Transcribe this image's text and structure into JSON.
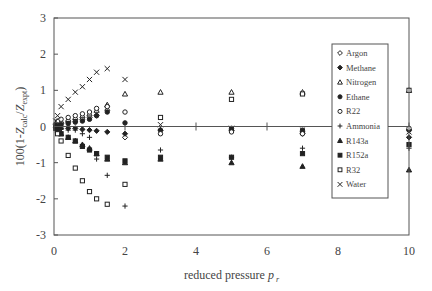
{
  "chart_data": {
    "type": "scatter",
    "title": "",
    "xlabel": "reduced pressure p_r",
    "xlabel_main": "reduced pressure ",
    "xlabel_var": "p",
    "xlabel_sub": "r",
    "ylabel": "100(1-Z_calc/Z_expt)",
    "ylabel_parts": {
      "prefix": "100(1-",
      "z1": "Z",
      "sub1": "calc",
      "slash": "/",
      "z2": "Z",
      "sub2": "expt",
      "suffix": ")"
    },
    "xlim": [
      0,
      10
    ],
    "ylim": [
      -3,
      3
    ],
    "xticks": [
      0,
      2,
      4,
      6,
      8,
      10
    ],
    "yticks": [
      -3,
      -2,
      -1,
      0,
      1,
      2,
      3
    ],
    "grid": false,
    "zero_line": true,
    "legend_position": "upper right (inside)",
    "series": [
      {
        "name": "Argon",
        "marker": "open-diamond",
        "x": [
          0.05,
          0.1,
          0.2,
          0.4,
          0.6,
          0.8,
          1.0,
          1.2,
          1.5,
          2.0,
          3.0,
          5.0,
          7.0,
          10.0
        ],
        "y": [
          0.05,
          0.05,
          0.08,
          0.12,
          0.15,
          0.2,
          0.25,
          0.3,
          0.45,
          -0.3,
          -0.1,
          -0.1,
          -0.2,
          -0.1
        ]
      },
      {
        "name": "Methane",
        "marker": "filled-diamond",
        "x": [
          0.05,
          0.1,
          0.2,
          0.4,
          0.6,
          0.8,
          1.0,
          1.2,
          1.5,
          2.0,
          3.0,
          5.0,
          7.0,
          10.0
        ],
        "y": [
          -0.02,
          -0.03,
          -0.05,
          -0.05,
          -0.05,
          -0.08,
          -0.1,
          -0.12,
          -0.15,
          -0.2,
          -0.1,
          -0.1,
          -0.15,
          -0.3
        ]
      },
      {
        "name": "Nitrogen",
        "marker": "open-triangle",
        "x": [
          0.1,
          0.2,
          0.4,
          0.6,
          0.8,
          1.0,
          1.2,
          1.5,
          2.0,
          3.0,
          5.0,
          7.0,
          10.0
        ],
        "y": [
          0.1,
          0.15,
          0.2,
          0.25,
          0.3,
          0.35,
          0.45,
          0.6,
          0.9,
          0.95,
          0.95,
          0.95,
          1.0
        ]
      },
      {
        "name": "Ethane",
        "marker": "filled-circle",
        "x": [
          0.05,
          0.1,
          0.2,
          0.4,
          0.6,
          0.8,
          1.0,
          1.2,
          1.5,
          2.0,
          3.0,
          5.0,
          7.0,
          10.0
        ],
        "y": [
          0.02,
          0.03,
          0.05,
          0.08,
          0.12,
          0.15,
          0.2,
          0.3,
          0.4,
          0.1,
          -0.1,
          -0.05,
          -0.1,
          -0.1
        ]
      },
      {
        "name": "R22",
        "marker": "open-circle",
        "x": [
          0.1,
          0.2,
          0.4,
          0.6,
          0.8,
          1.0,
          1.2,
          1.5,
          2.0,
          3.0,
          5.0,
          7.0,
          10.0
        ],
        "y": [
          0.15,
          0.2,
          0.25,
          0.3,
          0.35,
          0.4,
          0.5,
          0.55,
          0.4,
          -0.2,
          -0.15,
          -0.2,
          -0.05
        ]
      },
      {
        "name": "Ammonia",
        "marker": "plus",
        "x": [
          0.05,
          0.1,
          0.2,
          0.4,
          0.6,
          0.8,
          1.0,
          1.2,
          1.5,
          2.0,
          3.0,
          5.0,
          7.0,
          10.0
        ],
        "y": [
          -0.05,
          -0.05,
          -0.08,
          -0.1,
          -0.1,
          -0.2,
          -0.3,
          -0.9,
          -1.35,
          -2.2,
          -0.65,
          -0.85,
          -0.6,
          -0.6
        ]
      },
      {
        "name": "R143a",
        "marker": "filled-triangle",
        "x": [
          0.1,
          0.2,
          0.4,
          0.6,
          0.8,
          1.0,
          1.2,
          1.5,
          2.0,
          3.0,
          5.0,
          7.0,
          10.0
        ],
        "y": [
          -0.1,
          -0.2,
          -0.3,
          -0.4,
          -0.5,
          -0.6,
          -0.75,
          -0.9,
          -1.0,
          -0.9,
          -1.0,
          -1.1,
          -1.2
        ]
      },
      {
        "name": "R152a",
        "marker": "filled-square",
        "x": [
          0.05,
          0.1,
          0.2,
          0.4,
          0.6,
          0.8,
          1.0,
          1.2,
          1.5,
          2.0,
          3.0,
          5.0,
          7.0,
          10.0
        ],
        "y": [
          -0.05,
          -0.1,
          -0.2,
          -0.3,
          -0.4,
          -0.55,
          -0.65,
          -0.75,
          -0.85,
          -0.95,
          -0.85,
          -0.85,
          -0.75,
          -0.5
        ]
      },
      {
        "name": "R32",
        "marker": "open-square",
        "x": [
          0.1,
          0.2,
          0.4,
          0.6,
          0.8,
          1.0,
          1.2,
          1.5,
          2.0,
          3.0,
          5.0,
          7.0,
          10.0
        ],
        "y": [
          -0.2,
          -0.4,
          -0.8,
          -1.15,
          -1.5,
          -1.8,
          -2.0,
          -2.15,
          -1.6,
          0.25,
          0.75,
          0.9,
          1.0
        ]
      },
      {
        "name": "Water",
        "marker": "x",
        "x": [
          0.05,
          0.1,
          0.2,
          0.4,
          0.6,
          0.8,
          1.0,
          1.2,
          1.5,
          2.0,
          3.0,
          5.0,
          7.0,
          10.0
        ],
        "y": [
          0.15,
          0.3,
          0.55,
          0.75,
          0.95,
          1.1,
          1.3,
          1.5,
          1.6,
          1.3,
          0.05,
          -0.05,
          -0.1,
          -0.15
        ]
      }
    ]
  },
  "plot": {
    "left": 54,
    "right": 409,
    "top": 18,
    "bottom": 235,
    "color": "#555555"
  },
  "legend": {
    "items": [
      "Argon",
      "Methane",
      "Nitrogen",
      "Ethane",
      "R22",
      "Ammonia",
      "R143a",
      "R152a",
      "R32",
      "Water"
    ]
  }
}
